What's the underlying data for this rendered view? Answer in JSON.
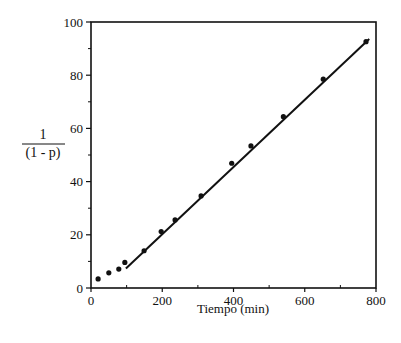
{
  "chart_data": {
    "type": "scatter",
    "title": "",
    "xlabel": "Tiempo (min)",
    "ylabel_numerator": "1",
    "ylabel_denominator": "(1 - p)",
    "ylabel": "1/(1 - p)",
    "xlim": [
      0,
      800
    ],
    "ylim": [
      0,
      100
    ],
    "x_ticks": [
      0,
      200,
      400,
      600,
      800
    ],
    "x_minor_ticks": [
      100,
      300,
      500,
      700
    ],
    "y_ticks": [
      0,
      20,
      40,
      60,
      80,
      100
    ],
    "y_minor_ticks": [
      10,
      30,
      50,
      70,
      90
    ],
    "grid": false,
    "legend": null,
    "series": [
      {
        "name": "datos experimentales",
        "kind": "scatter",
        "x": [
          20,
          50,
          78,
          95,
          149,
          197,
          236,
          309,
          395,
          449,
          540,
          652,
          772
        ],
        "y": [
          3.4,
          5.7,
          7.1,
          9.6,
          14.0,
          21.2,
          25.6,
          34.6,
          46.9,
          53.4,
          64.4,
          78.5,
          92.6
        ]
      },
      {
        "name": "ajuste lineal",
        "kind": "line",
        "x": [
          98,
          781
        ],
        "y": [
          7.3,
          93.6
        ]
      }
    ]
  },
  "layout": {
    "plot_left": 91,
    "plot_right": 376,
    "plot_top": 22,
    "plot_bottom": 288,
    "line_color": "#111111",
    "marker_color": "#111111",
    "background": "#ffffff"
  }
}
